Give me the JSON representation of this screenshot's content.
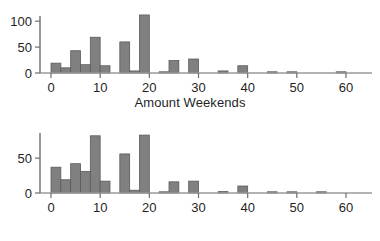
{
  "figure": {
    "background_color": "#ffffff",
    "bar_fill_color": "#808080",
    "bar_edge_color": "#5a5a5a",
    "axis_color": "#9a9a9a",
    "text_color": "#1f1f1f"
  },
  "chart_data": [
    {
      "type": "bar",
      "title": "",
      "xlabel": "Amount Weekends",
      "ylabel": "",
      "xlim": [
        -2,
        62
      ],
      "ylim": [
        0,
        115
      ],
      "xticks": [
        0,
        10,
        20,
        30,
        40,
        50,
        60
      ],
      "xticklabels": [
        "0",
        "10",
        "20",
        "30",
        "40",
        "50",
        "60"
      ],
      "yticks": [
        0,
        50,
        100
      ],
      "yticklabels": [
        "0",
        "50",
        "100"
      ],
      "grid": false,
      "legend": false,
      "bin_width": 2,
      "bin_starts": [
        0,
        2,
        4,
        6,
        8,
        10,
        14,
        16,
        18,
        22,
        24,
        28,
        34,
        38,
        44,
        48,
        58
      ],
      "values": [
        19,
        10,
        43,
        16,
        69,
        14,
        60,
        4,
        112,
        1,
        24,
        27,
        4,
        14,
        1,
        1,
        1
      ]
    },
    {
      "type": "bar",
      "title": "",
      "xlabel": "Amount Weekdays",
      "ylabel": "",
      "xlim": [
        -2,
        62
      ],
      "ylim": [
        0,
        88
      ],
      "xticks": [
        0,
        10,
        20,
        30,
        40,
        50,
        60
      ],
      "xticklabels": [
        "0",
        "10",
        "20",
        "30",
        "40",
        "50",
        "60"
      ],
      "yticks": [
        0,
        50
      ],
      "yticklabels": [
        "0",
        "50"
      ],
      "grid": false,
      "legend": false,
      "bin_width": 2,
      "bin_starts": [
        0,
        2,
        4,
        6,
        8,
        10,
        14,
        16,
        18,
        22,
        24,
        28,
        34,
        38,
        44,
        48,
        54
      ],
      "values": [
        37,
        19,
        42,
        31,
        82,
        17,
        56,
        4,
        83,
        1,
        16,
        17,
        2,
        10,
        1,
        1,
        1
      ]
    }
  ],
  "panels": [
    {
      "name": "weekends",
      "xlabel": "Amount Weekends"
    },
    {
      "name": "weekdays",
      "xlabel": "Amount Weekdays"
    }
  ]
}
